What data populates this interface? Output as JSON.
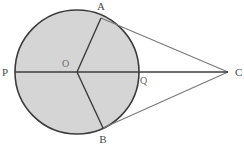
{
  "figure": {
    "kind": "circle-with-two-tangents",
    "background_color": "#ffffff",
    "canvas": {
      "width": 244,
      "height": 146
    }
  },
  "circle": {
    "name": "circle-O",
    "center_x": 77,
    "center_y": 72,
    "radius": 62,
    "fill_color": "#d5d5d5",
    "stroke_color": "#3c3c3c",
    "stroke_width": 1.6
  },
  "points": {
    "A": {
      "label": "A",
      "x": 101,
      "y": 18,
      "label_x": 101,
      "label_y": 10
    },
    "B": {
      "label": "B",
      "x": 103,
      "y": 128,
      "label_x": 103,
      "label_y": 143
    },
    "C": {
      "label": "C",
      "x": 228,
      "y": 72,
      "label_x": 235,
      "label_y": 76
    },
    "O": {
      "label": "O",
      "x": 77,
      "y": 72,
      "label_x": 62,
      "label_y": 67
    },
    "P": {
      "label": "P",
      "x": 15,
      "y": 72,
      "label_x": 2,
      "label_y": 76
    },
    "Q": {
      "label": "Q",
      "x": 139,
      "y": 72,
      "label_x": 140,
      "label_y": 84
    }
  },
  "segments": [
    {
      "name": "diameter-PC",
      "from": "P",
      "to": "C",
      "color": "#3c3c3c",
      "width": 1.4
    },
    {
      "name": "radius-OA",
      "from": "O",
      "to": "A",
      "color": "#3c3c3c",
      "width": 1.4
    },
    {
      "name": "radius-OB",
      "from": "O",
      "to": "B",
      "color": "#3c3c3c",
      "width": 1.4
    },
    {
      "name": "tangent-AC",
      "from": "A",
      "to": "C",
      "color": "#7a7a7a",
      "width": 1.2
    },
    {
      "name": "tangent-BC",
      "from": "B",
      "to": "C",
      "color": "#7a7a7a",
      "width": 1.2
    }
  ],
  "labels_text": {
    "A": "A",
    "B": "B",
    "C": "C",
    "O": "O",
    "P": "P",
    "Q": "Q"
  }
}
